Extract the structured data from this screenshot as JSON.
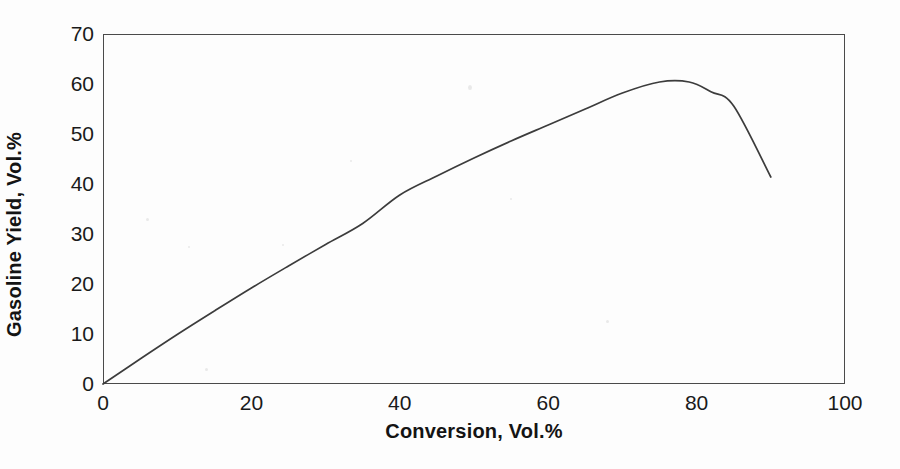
{
  "chart_data": {
    "type": "line",
    "title": "",
    "xlabel": "Conversion, Vol.%",
    "ylabel": "Gasoline Yield, Vol.%",
    "xlim": [
      0,
      100
    ],
    "ylim": [
      0,
      70
    ],
    "xticks": [
      0,
      20,
      40,
      60,
      80,
      100
    ],
    "yticks": [
      0,
      10,
      20,
      30,
      40,
      50,
      60,
      70
    ],
    "xtick_labels": [
      "0",
      "20",
      "40",
      "60",
      "80",
      "100"
    ],
    "ytick_labels": [
      "0",
      "10",
      "20",
      "30",
      "40",
      "50",
      "60",
      "70"
    ],
    "grid": false,
    "legend": false,
    "legend_position": "none",
    "line_color": "#3c3c3c",
    "series": [
      {
        "name": "Gasoline Yield",
        "x": [
          0,
          5,
          10,
          15,
          20,
          25,
          30,
          35,
          40,
          45,
          50,
          55,
          60,
          65,
          70,
          75,
          79,
          82,
          85,
          90
        ],
        "y": [
          0,
          5.0,
          9.9,
          14.6,
          19.2,
          23.6,
          27.9,
          32.1,
          37.8,
          41.6,
          45.2,
          48.6,
          51.8,
          55.0,
          58.2,
          60.4,
          60.4,
          58.4,
          55.6,
          41.4
        ]
      }
    ]
  },
  "figure": {
    "background_color": "#fdfdfd",
    "frame_color": "#4a4a4a",
    "text_color": "#1a1a1a"
  }
}
